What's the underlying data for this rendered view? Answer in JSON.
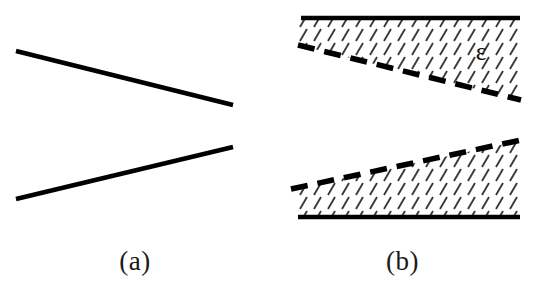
{
  "figure": {
    "background_color": "#ffffff",
    "ink_color": "#000000",
    "hatch_color": "#3a3a3a",
    "caption_color": "#1a1a1a"
  },
  "panels": [
    {
      "id": "a",
      "caption": "(a)",
      "description": "Two diverging straight solid lines forming an open wedge",
      "elements": [
        {
          "name": "upper-wall-line",
          "type": "solid-line",
          "x1": 16,
          "y1": 51,
          "x2": 233,
          "y2": 105,
          "stroke_width": 4.5
        },
        {
          "name": "lower-wall-line",
          "type": "solid-line",
          "x1": 16,
          "y1": 199,
          "x2": 233,
          "y2": 147,
          "stroke_width": 4.5
        }
      ]
    },
    {
      "id": "b",
      "caption": "(b)",
      "label_epsilon": "ε",
      "description": "Same wedge geometry with hatched boundary-layer regions bounded by thick dashed lines",
      "elements": [
        {
          "name": "upper-solid-wall",
          "type": "solid-line",
          "x1": 32,
          "y1": 18,
          "x2": 249,
          "y2": 18,
          "stroke_width": 4.5
        },
        {
          "name": "upper-dashed-boundary",
          "type": "dashed-line",
          "x1": 28,
          "y1": 45,
          "x2": 250,
          "y2": 100,
          "stroke_width": 5.5,
          "dash": "16 10"
        },
        {
          "name": "upper-hatched-region",
          "type": "hatched-area",
          "hatch_angle_deg": 60,
          "hatch_spacing": 14
        },
        {
          "name": "lower-dashed-boundary",
          "type": "dashed-line",
          "x1": 22,
          "y1": 189,
          "x2": 250,
          "y2": 141,
          "stroke_width": 5.5,
          "dash": "16 10"
        },
        {
          "name": "lower-solid-wall",
          "type": "solid-line",
          "x1": 28,
          "y1": 217,
          "x2": 250,
          "y2": 217,
          "stroke_width": 4.5
        },
        {
          "name": "lower-hatched-region",
          "type": "hatched-area",
          "hatch_angle_deg": 60,
          "hatch_spacing": 14
        },
        {
          "name": "epsilon-label",
          "type": "text",
          "value": "ε",
          "x": 210,
          "y": 58,
          "font_size": 24
        }
      ]
    }
  ]
}
